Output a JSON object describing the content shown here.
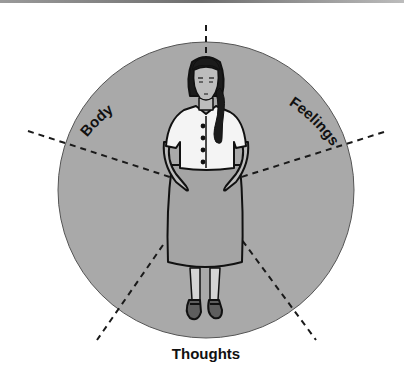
{
  "figure": {
    "type": "wheel-diagram",
    "colors": {
      "circle_fill": "#a9a9a9",
      "circle_stroke": "#555555",
      "dash_color": "#1a1a1a",
      "label_color": "#111111",
      "skin": "#bdbdbd",
      "skirt": "#a4a4a4",
      "blouse": "#f4f4f4",
      "hair": "#1b1b1b"
    },
    "labels": {
      "body": "Body",
      "feelings": "Feelings",
      "awareness": "Awareness",
      "thoughts": "Thoughts",
      "consciousness": "Consciousness"
    }
  }
}
